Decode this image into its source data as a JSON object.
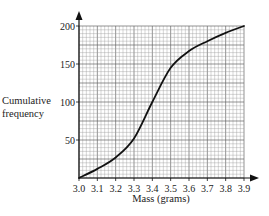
{
  "chart_data": {
    "type": "line",
    "title": "",
    "xlabel": "Mass (grams)",
    "ylabel": "Cumulative frequency",
    "ylabel_lines": [
      "Cumulative",
      "frequency"
    ],
    "x": [
      3.0,
      3.1,
      3.2,
      3.3,
      3.4,
      3.5,
      3.6,
      3.7,
      3.8,
      3.9
    ],
    "series": [
      {
        "name": "Cumulative frequency",
        "values": [
          0,
          12,
          27,
          52,
          100,
          145,
          167,
          180,
          191,
          200
        ]
      }
    ],
    "xlim": [
      3.0,
      3.9
    ],
    "ylim": [
      0,
      200
    ],
    "x_ticks": [
      "3.0",
      "3.1",
      "3.2",
      "3.3",
      "3.4",
      "3.5",
      "3.6",
      "3.7",
      "3.8",
      "3.9"
    ],
    "y_ticks": [
      "50",
      "100",
      "150",
      "200"
    ],
    "grid": true,
    "legend": "none",
    "colors": {
      "curve": "#111111",
      "grid_major": "#666666",
      "grid_minor": "#9a9a9a",
      "axis": "#111111"
    }
  }
}
